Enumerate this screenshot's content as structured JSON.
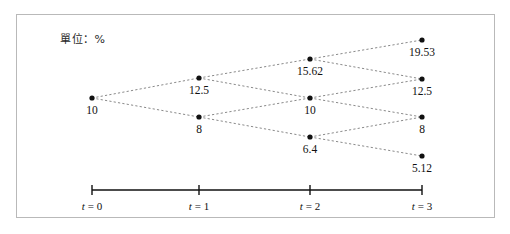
{
  "figure": {
    "unit_note": "單位：%",
    "border_color": "#b9b9b9",
    "node_color": "#111111",
    "edge_color": "#8a8a8a"
  },
  "axis": {
    "ticks": [
      {
        "label_t": "t",
        "label_eq": "= 0",
        "value": 0
      },
      {
        "label_t": "t",
        "label_eq": "= 1",
        "value": 1
      },
      {
        "label_t": "t",
        "label_eq": "= 2",
        "value": 2
      },
      {
        "label_t": "t",
        "label_eq": "= 3",
        "value": 3
      }
    ]
  },
  "chart_data": {
    "type": "scatter",
    "title": "",
    "subtitle": "",
    "xlabel": "t",
    "ylabel": "",
    "annotations": [
      "單位：%"
    ],
    "grid": false,
    "legend": null,
    "x": [
      0,
      1,
      2,
      3
    ],
    "xticklabels": [
      "t = 0",
      "t = 1",
      "t = 2",
      "t = 3"
    ],
    "lattice": {
      "up_factor": 1.25,
      "down_factor": 0.8,
      "recombining": true,
      "levels": [
        {
          "t": 0,
          "values": [
            10
          ]
        },
        {
          "t": 1,
          "values": [
            12.5,
            8
          ]
        },
        {
          "t": 2,
          "values": [
            15.62,
            10,
            6.4
          ]
        },
        {
          "t": 3,
          "values": [
            19.53,
            12.5,
            8,
            5.12
          ]
        }
      ]
    },
    "nodes": [
      {
        "id": "n0_0",
        "t": 0,
        "k": 0,
        "value": "10",
        "x": 92,
        "y": 98,
        "label_x": 92,
        "label_y": 104
      },
      {
        "id": "n1_0",
        "t": 1,
        "k": 0,
        "value": "12.5",
        "x": 199,
        "y": 78,
        "label_x": 199,
        "label_y": 84
      },
      {
        "id": "n1_1",
        "t": 1,
        "k": 1,
        "value": "8",
        "x": 199,
        "y": 117,
        "label_x": 199,
        "label_y": 123
      },
      {
        "id": "n2_0",
        "t": 2,
        "k": 0,
        "value": "15.62",
        "x": 310,
        "y": 59,
        "label_x": 310,
        "label_y": 65
      },
      {
        "id": "n2_1",
        "t": 2,
        "k": 1,
        "value": "10",
        "x": 310,
        "y": 98,
        "label_x": 310,
        "label_y": 104
      },
      {
        "id": "n2_2",
        "t": 2,
        "k": 2,
        "value": "6.4",
        "x": 310,
        "y": 137,
        "label_x": 310,
        "label_y": 143
      },
      {
        "id": "n3_0",
        "t": 3,
        "k": 0,
        "value": "19.53",
        "x": 422,
        "y": 40,
        "label_x": 422,
        "label_y": 46
      },
      {
        "id": "n3_1",
        "t": 3,
        "k": 1,
        "value": "12.5",
        "x": 422,
        "y": 79,
        "label_x": 422,
        "label_y": 85
      },
      {
        "id": "n3_2",
        "t": 3,
        "k": 2,
        "value": "8",
        "x": 422,
        "y": 117,
        "label_x": 422,
        "label_y": 123
      },
      {
        "id": "n3_3",
        "t": 3,
        "k": 3,
        "value": "5.12",
        "x": 422,
        "y": 156,
        "label_x": 422,
        "label_y": 162
      }
    ],
    "edges": [
      {
        "from": "n0_0",
        "to": "n1_0"
      },
      {
        "from": "n0_0",
        "to": "n1_1"
      },
      {
        "from": "n1_0",
        "to": "n2_0"
      },
      {
        "from": "n1_0",
        "to": "n2_1"
      },
      {
        "from": "n1_1",
        "to": "n2_1"
      },
      {
        "from": "n1_1",
        "to": "n2_2"
      },
      {
        "from": "n2_0",
        "to": "n3_0"
      },
      {
        "from": "n2_0",
        "to": "n3_1"
      },
      {
        "from": "n2_1",
        "to": "n3_1"
      },
      {
        "from": "n2_1",
        "to": "n3_2"
      },
      {
        "from": "n2_2",
        "to": "n3_2"
      },
      {
        "from": "n2_2",
        "to": "n3_3"
      }
    ],
    "axis_line": {
      "x1": 92,
      "x2": 422,
      "y": 190,
      "tick_half_height": 5
    },
    "axis_ticks_x": [
      92,
      199,
      310,
      422
    ],
    "axis_label_y": 200
  }
}
